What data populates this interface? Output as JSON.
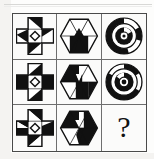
{
  "puzzle": {
    "type": "matrix-reasoning",
    "title": "3x3 visual analogy matrix",
    "rows": 3,
    "columns": 3,
    "missing_cell": {
      "row": 3,
      "column": 3,
      "label": "?"
    },
    "colors": {
      "ink": "#111111",
      "paper": "#fbfbfa",
      "frame": "#4a4a4a",
      "cell_divider": "#6e6e6e",
      "fill_black": "#111111",
      "fill_white": "#ffffff"
    },
    "cells": [
      {
        "id": "cell-r1c1",
        "row": 1,
        "column": 1,
        "shape": "cross",
        "description": "Greek cross with black and white triangular wedge fills",
        "icon_name": "cross-shape-icon"
      },
      {
        "id": "cell-r1c2",
        "row": 1,
        "column": 2,
        "shape": "hexagon",
        "description": "Hexagon divided into black and white triangular wedges",
        "icon_name": "hexagon-shape-icon"
      },
      {
        "id": "cell-r1c3",
        "row": 1,
        "column": 3,
        "shape": "concentric-rings",
        "description": "Black disc with concentric rings and white gap sectors",
        "icon_name": "ring-shape-icon"
      },
      {
        "id": "cell-r2c1",
        "row": 2,
        "column": 1,
        "shape": "cross",
        "description": "Greek cross with black and white triangular wedge fills, variant 2",
        "icon_name": "cross-shape-icon"
      },
      {
        "id": "cell-r2c2",
        "row": 2,
        "column": 2,
        "shape": "hexagon",
        "description": "Hexagon divided into black and white triangular wedges, variant 2",
        "icon_name": "hexagon-shape-icon"
      },
      {
        "id": "cell-r2c3",
        "row": 2,
        "column": 3,
        "shape": "concentric-rings",
        "description": "Black disc with concentric rings and white gap sectors, variant 2",
        "icon_name": "ring-shape-icon"
      },
      {
        "id": "cell-r3c1",
        "row": 3,
        "column": 1,
        "shape": "cross",
        "description": "Greek cross with black and white triangular wedge fills, variant 3",
        "icon_name": "cross-shape-icon"
      },
      {
        "id": "cell-r3c2",
        "row": 3,
        "column": 2,
        "shape": "hexagon",
        "description": "Hexagon divided into black and white triangular wedges, variant 3",
        "icon_name": "hexagon-shape-icon"
      },
      {
        "id": "cell-r3c3",
        "row": 3,
        "column": 3,
        "shape": "question-mark",
        "description": "Empty answer cell marked with a question mark",
        "icon_name": "question-mark-icon",
        "label": "?"
      }
    ]
  }
}
